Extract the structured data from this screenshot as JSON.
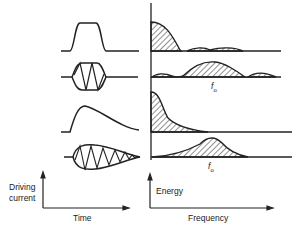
{
  "diagram": {
    "rows": [
      {
        "time_shape": "square-pulse",
        "spectrum": "low-frequency-sinc"
      },
      {
        "time_shape": "modulated-square-pulse",
        "spectrum": "centered-at-f0-with-sidelobes",
        "marker": "f"
      },
      {
        "time_shape": "fast-rise-exponential-decay",
        "spectrum": "low-frequency-decay"
      },
      {
        "time_shape": "damped-oscillation",
        "spectrum": "peak-at-f0",
        "marker": "f"
      }
    ],
    "marker_subscript": "o",
    "left_axis": {
      "ylabel_line1": "Driving",
      "ylabel_line2": "current",
      "xlabel": "Time"
    },
    "right_axis": {
      "ylabel": "Energy",
      "xlabel": "Frequency"
    }
  }
}
